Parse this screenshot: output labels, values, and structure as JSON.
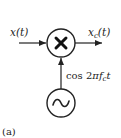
{
  "diagram": {
    "input_label": "x(t)",
    "output_label_main": "x",
    "output_label_sub": "c",
    "output_label_arg": "(t)",
    "carrier_label_prefix": "cos 2",
    "carrier_label_pi": "π",
    "carrier_label_f": "f",
    "carrier_label_sub": "c",
    "carrier_label_t": "t",
    "multiplier_symbol": "✖",
    "oscillator_symbol": "~",
    "caption": "(a)"
  }
}
